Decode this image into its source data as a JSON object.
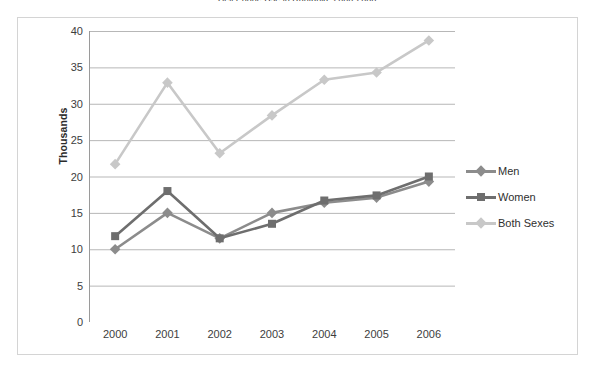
{
  "chart_data": {
    "type": "line",
    "title": "Cell Phone Use in Ruritania, 2000-2006",
    "xlabel": "",
    "ylabel": "Thousands",
    "categories": [
      "2000",
      "2001",
      "2002",
      "2003",
      "2004",
      "2005",
      "2006"
    ],
    "ylim": [
      0,
      40
    ],
    "ytick_values": [
      0,
      5,
      10,
      15,
      20,
      25,
      30,
      35,
      40
    ],
    "ytick_labels": [
      "0",
      "5",
      "10",
      "15",
      "20",
      "25",
      "30",
      "35",
      "40"
    ],
    "grid": true,
    "legend_position": "right",
    "series": [
      {
        "name": "Men",
        "color": "#8c8c8c",
        "marker": "diamond",
        "values": [
          10.0,
          15.0,
          11.5,
          15.0,
          16.4,
          17.1,
          19.3
        ]
      },
      {
        "name": "Women",
        "color": "#6e6e6e",
        "marker": "square",
        "values": [
          11.8,
          18.0,
          11.5,
          13.5,
          16.7,
          17.4,
          20.0
        ]
      },
      {
        "name": "Both Sexes",
        "color": "#c8c8c8",
        "marker": "diamond",
        "values": [
          21.7,
          32.9,
          23.2,
          28.4,
          33.3,
          34.3,
          38.7
        ]
      }
    ]
  },
  "colors": {
    "frame": "#d4d4d4",
    "gridline": "#b7b7b7",
    "axis": "#9a9a9a",
    "text": "#3d3d3d",
    "background": "#ffffff"
  }
}
